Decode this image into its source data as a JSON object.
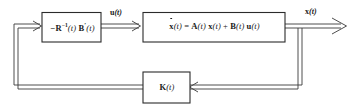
{
  "diagram": {
    "line_color": "#3a3a3a",
    "block_stroke_color": "#2b2b2b",
    "background_color": "#ffffff",
    "blocks": [
      {
        "id": "controller",
        "name": "controller-block",
        "expr_plain": "-R^{-1}(t) B'(t)",
        "parts": {
          "minus": "−",
          "R": "R",
          "R_exp": "−1",
          "R_arg": "(t)",
          "B": "B",
          "B_prime": "′",
          "B_arg": "(t)"
        }
      },
      {
        "id": "plant",
        "name": "plant-state-equation-block",
        "expr_plain": "ẋ(t) = A(t) x(t) + B(t) u(t)",
        "parts": {
          "xdot": "x",
          "xdot_arg": "(t)",
          "equals": "=",
          "A": "A",
          "A_arg": "(t)",
          "x": "x",
          "x_arg": "(t)",
          "plus": "+",
          "B": "B",
          "B_arg": "(t)",
          "u": "u",
          "u_arg": "(t)"
        }
      },
      {
        "id": "gain",
        "name": "feedback-gain-block",
        "expr_plain": "K(t)",
        "parts": {
          "K": "K",
          "K_arg": "(t)"
        }
      }
    ],
    "signals": [
      {
        "id": "u",
        "name": "control-signal-label",
        "symbol": "u",
        "arg": "(t)",
        "plain": "u(t)"
      },
      {
        "id": "x",
        "name": "state-output-signal-label",
        "symbol": "x",
        "arg": "(t)",
        "plain": "x(t)"
      }
    ]
  }
}
